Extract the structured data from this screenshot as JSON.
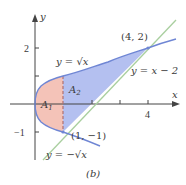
{
  "figure": {
    "caption": "(b)",
    "axes": {
      "x_label": "x",
      "y_label": "y",
      "x_ticks": [
        {
          "value": 4,
          "label": "4"
        }
      ],
      "y_ticks": [
        {
          "value": 2,
          "label": "2"
        },
        {
          "value": -1,
          "label": "−1"
        }
      ]
    },
    "curves": {
      "upper_label": "y = √x",
      "lower_label": "y = −√x",
      "line_label": "y = x − 2"
    },
    "points": [
      {
        "label": "(4, 2)",
        "x": 4,
        "y": 2
      },
      {
        "label": "(1, −1)",
        "x": 1,
        "y": -1
      }
    ],
    "regions": {
      "a1_label": "A",
      "a1_sub": "1",
      "a2_label": "A",
      "a2_sub": "2"
    },
    "colors": {
      "region_a1": "#f4c3b8",
      "region_a2": "#b4c0f0",
      "curve": "#6f86d4",
      "line": "#a9cf9f",
      "axis": "#444444",
      "dashed": "#b07070"
    }
  }
}
